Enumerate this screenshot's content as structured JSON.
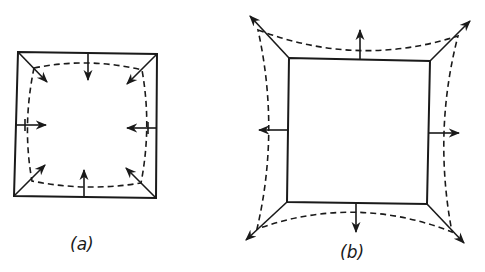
{
  "figure": {
    "panels": [
      {
        "id": "a",
        "label": "(a)",
        "description": "Square with inward-pointing arrows; dashed contour contracted inward (barrel shape)",
        "square": {
          "tl": [
            18,
            52
          ],
          "tr": [
            157,
            54
          ],
          "br": [
            156,
            198
          ],
          "bl": [
            14,
            196
          ]
        },
        "arrow_direction": "inward"
      },
      {
        "id": "b",
        "label": "(b)",
        "description": "Square with outward-pointing arrows; dashed contour expanded outward at corners (pincushion shape)",
        "square": {
          "tl": [
            289,
            58
          ],
          "tr": [
            430,
            61
          ],
          "br": [
            427,
            204
          ],
          "bl": [
            287,
            202
          ]
        },
        "arrow_direction": "outward"
      }
    ],
    "colors": {
      "ink": "#1a1a1a",
      "background": "#ffffff"
    }
  }
}
